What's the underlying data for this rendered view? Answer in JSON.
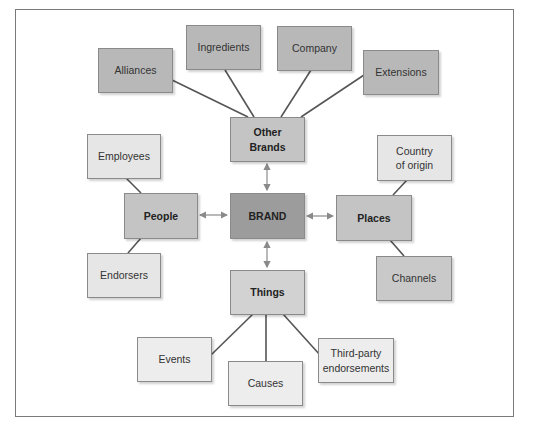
{
  "diagram": {
    "center": {
      "label": "BRAND"
    },
    "primary": {
      "other_brands": {
        "label": "Other\nBrands"
      },
      "people": {
        "label": "People"
      },
      "places": {
        "label": "Places"
      },
      "things": {
        "label": "Things"
      }
    },
    "secondary": {
      "alliances": {
        "label": "Alliances"
      },
      "ingredients": {
        "label": "Ingredients"
      },
      "company": {
        "label": "Company"
      },
      "extensions": {
        "label": "Extensions"
      },
      "employees": {
        "label": "Employees"
      },
      "endorsers": {
        "label": "Endorsers"
      },
      "country_of_origin": {
        "label": "Country\nof origin"
      },
      "channels": {
        "label": "Channels"
      },
      "events": {
        "label": "Events"
      },
      "causes": {
        "label": "Causes"
      },
      "third_party": {
        "label": "Third-party\nendorsements"
      }
    },
    "colors": {
      "outer_gray": "#b8b8b8",
      "mid_gray": "#c4c4c4",
      "light_gray": "#e6e6e6",
      "core_gray": "#9c9c9c",
      "line": "#555555",
      "arrow": "#8a8a8a"
    }
  }
}
